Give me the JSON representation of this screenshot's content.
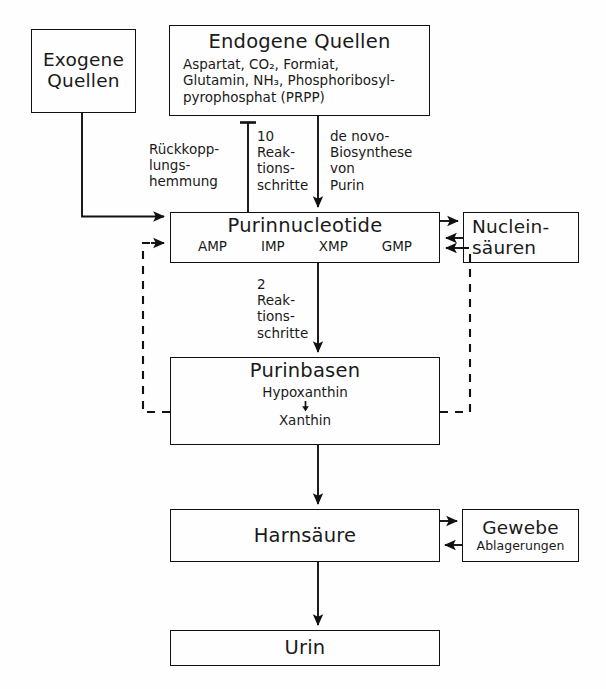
{
  "diagram": {
    "line_color": "#111111",
    "background": "#fefefe"
  },
  "boxes": {
    "exogene": {
      "title": "Exogene\nQuellen"
    },
    "endogene": {
      "title": "Endogene Quellen",
      "sub": "Aspartat, CO₂, Formiat,\nGlutamin, NH₃, Phosphoribosyl-\npyrophosphat (PRPP)"
    },
    "purinnucleotide": {
      "title": "Purinnucleotide",
      "nucleotides": [
        "AMP",
        "IMP",
        "XMP",
        "GMP"
      ]
    },
    "nucleinsauren": {
      "title": "Nuclein-\nsäuren"
    },
    "purinbasen": {
      "title": "Purinbasen",
      "chain_top": "Hypoxanthin",
      "chain_bottom": "Xanthin"
    },
    "harnsaure": {
      "title": "Harnsäure"
    },
    "gewebe": {
      "title": "Gewebe",
      "sub": "Ablagerungen"
    },
    "urin": {
      "title": "Urin"
    }
  },
  "connector_labels": {
    "rueckkopplungshemmung": "Rückkopp-\nlungs-\nhemmung",
    "zehn_reaktionsschritte": "10\nReak-\ntions-\nschritte",
    "de_novo_biosynthese": "de novo-\nBiosynthese\nvon\nPurin",
    "zwei_reaktionsschritte": "2\nReak-\ntions-\nschritte"
  }
}
